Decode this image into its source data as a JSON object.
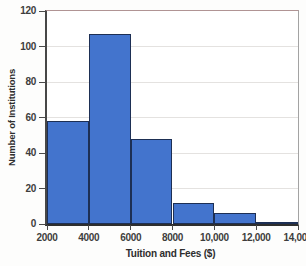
{
  "chart_data": {
    "type": "bar",
    "subtype": "histogram",
    "title": "",
    "xlabel": "Tuition and Fees ($)",
    "ylabel": "Number of Institutions",
    "bin_edges": [
      2000,
      4000,
      6000,
      8000,
      10000,
      12000,
      14000
    ],
    "values": [
      58,
      107,
      48,
      12,
      6,
      1
    ],
    "bin_names": [
      "2000-4000",
      "4000-6000",
      "6000-8000",
      "8000-10000",
      "10000-12000",
      "12000-14000"
    ],
    "x_ticks": [
      2000,
      4000,
      6000,
      8000,
      10000,
      12000,
      14000
    ],
    "x_tick_labels": [
      "2000",
      "4000",
      "6000",
      "8000",
      "10,000",
      "12,000",
      "14,000"
    ],
    "y_ticks": [
      0,
      20,
      40,
      60,
      80,
      100,
      120
    ],
    "xlim": [
      2000,
      14000
    ],
    "ylim": [
      0,
      120
    ],
    "grid": "horizontal",
    "legend": "none",
    "colors": {
      "bar_fill": "#4374cd",
      "bar_border": "#1d2f54",
      "gridline": "#e4e2e0",
      "axis": "#2e2e2e",
      "plot_border": "#a3a3a3",
      "tick_label": "#3d3d3d"
    }
  }
}
